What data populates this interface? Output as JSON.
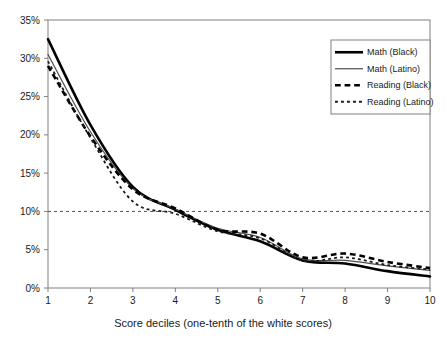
{
  "chart_data": {
    "type": "line",
    "title": "",
    "subtitle": "",
    "xlabel": "Score deciles (one-tenth of the white scores)",
    "ylabel": "",
    "x": [
      1,
      2,
      3,
      4,
      5,
      6,
      7,
      8,
      9,
      10
    ],
    "categories": [
      "1",
      "2",
      "3",
      "4",
      "5",
      "6",
      "7",
      "8",
      "9",
      "10"
    ],
    "xlim": [
      1,
      10
    ],
    "ylim": [
      0,
      35
    ],
    "ytick_values": [
      0,
      5,
      10,
      15,
      20,
      25,
      30,
      35
    ],
    "ytick_labels": [
      "0%",
      "5%",
      "10%",
      "15%",
      "20%",
      "25%",
      "30%",
      "35%"
    ],
    "xtick_labels": [
      "1",
      "2",
      "3",
      "4",
      "5",
      "6",
      "7",
      "8",
      "9",
      "10"
    ],
    "grid": false,
    "reference_line": {
      "value": 10,
      "label": "10%",
      "style": "dashed",
      "orientation": "horizontal",
      "color": "#555555"
    },
    "legend_position": "top-right",
    "series": [
      {
        "name": "Math (Black)",
        "style": "solid",
        "width": 2.6,
        "color": "#000000",
        "values": [
          32.5,
          21.3,
          13.2,
          10.2,
          7.6,
          6.1,
          3.6,
          3.2,
          2.2,
          1.5
        ]
      },
      {
        "name": "Math (Latino)",
        "style": "solid",
        "width": 1.2,
        "color": "#4d4d4d",
        "values": [
          30.5,
          20.4,
          13.0,
          10.3,
          7.8,
          6.6,
          3.8,
          3.6,
          2.9,
          2.3
        ]
      },
      {
        "name": "Reading (Black)",
        "style": "dashed",
        "width": 2.6,
        "color": "#000000",
        "values": [
          29.0,
          19.8,
          12.9,
          10.4,
          7.6,
          7.1,
          4.0,
          4.5,
          3.4,
          2.6
        ]
      },
      {
        "name": "Reading (Latino)",
        "style": "dotted",
        "width": 1.8,
        "color": "#1a1a1a",
        "values": [
          29.6,
          19.6,
          11.3,
          9.7,
          7.4,
          6.5,
          3.6,
          4.0,
          3.0,
          2.4
        ]
      }
    ]
  },
  "legend": {
    "items": [
      {
        "label": "Math (Black)"
      },
      {
        "label": "Math (Latino)"
      },
      {
        "label": "Reading (Black)"
      },
      {
        "label": "Reading (Latino)"
      }
    ]
  },
  "axes": {
    "x_title": "Score deciles (one-tenth of the white scores)"
  }
}
